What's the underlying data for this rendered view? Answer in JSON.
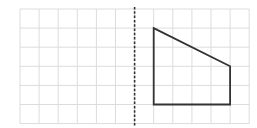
{
  "diagram": {
    "grid": {
      "columns": 12,
      "rows": 6,
      "origin_px": [
        20,
        9
      ],
      "cell_px": 19.1,
      "line_color": "#dcdcdc"
    },
    "mirror_line": {
      "type": "dashed-vertical",
      "grid_x": 6,
      "color": "#333333"
    },
    "shape": {
      "name": "trapezoid",
      "grid_vertices": [
        [
          7,
          1
        ],
        [
          11,
          3
        ],
        [
          11,
          5
        ],
        [
          7,
          5
        ]
      ],
      "stroke": "#333333"
    }
  }
}
